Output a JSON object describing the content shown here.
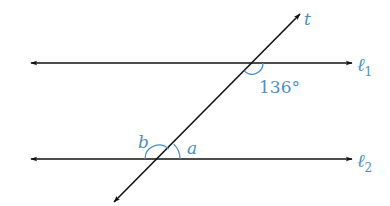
{
  "diagram": {
    "colors": {
      "line": "#111111",
      "label": "#4a90c8",
      "arc": "#4a90c8",
      "background": "#ffffff"
    },
    "lines": [
      {
        "id": "l1",
        "label_main": "ℓ",
        "label_sub": "1",
        "y": 63,
        "x_start": 30,
        "x_end": 353
      },
      {
        "id": "l2",
        "label_main": "ℓ",
        "label_sub": "2",
        "y": 159,
        "x_start": 30,
        "x_end": 353
      }
    ],
    "transversal": {
      "label": "t",
      "from": [
        113,
        203
      ],
      "to": [
        301,
        13
      ]
    },
    "angles": {
      "given": {
        "label": "136°",
        "value": 136,
        "at_line": "l1"
      },
      "a": {
        "label": "a",
        "at_line": "l2"
      },
      "b": {
        "label": "b",
        "at_line": "l2"
      }
    }
  }
}
